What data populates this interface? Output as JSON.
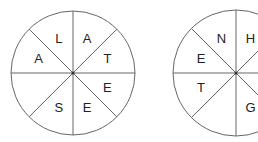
{
  "wheels": [
    {
      "name": "left-wheel",
      "cx": 73,
      "cy": 73,
      "r": 62,
      "segments": [
        "A",
        "T",
        "E",
        "E",
        "S",
        "",
        "A",
        "L"
      ]
    },
    {
      "name": "right-wheel",
      "cx": 236,
      "cy": 73,
      "r": 63,
      "segments": [
        "H",
        "",
        "",
        "G",
        "",
        "T",
        "E",
        "N"
      ]
    }
  ],
  "colors": {
    "stroke": "#666666",
    "text": "#222222"
  }
}
